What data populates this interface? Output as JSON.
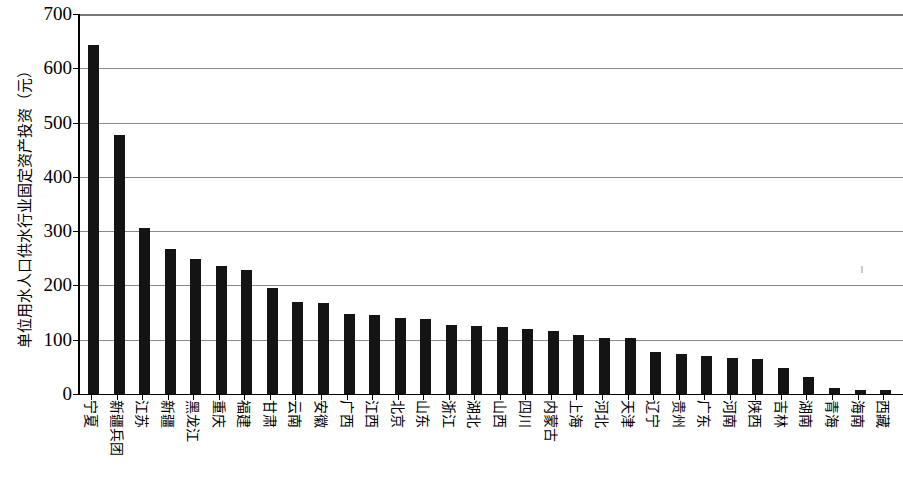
{
  "chart_data": {
    "type": "bar",
    "title": "",
    "subtitle": "",
    "xlabel": "",
    "ylabel": "单位用水人口供水行业固定资产投资（元）",
    "ylim": [
      0,
      700
    ],
    "ytick_labels": [
      "700",
      "600",
      "500",
      "400",
      "300",
      "200",
      "100",
      "0"
    ],
    "ytick_values": [
      700,
      600,
      500,
      400,
      300,
      200,
      100,
      0
    ],
    "grid": true,
    "legend": false,
    "legend_position": "none",
    "bar_color": "#141414",
    "grid_color": "#888888",
    "axis_color": "#000000",
    "categories": [
      "宁夏",
      "新疆兵团",
      "江苏",
      "新疆",
      "黑龙江",
      "重庆",
      "福建",
      "甘肃",
      "云南",
      "安徽",
      "广西",
      "江西",
      "北京",
      "山东",
      "浙江",
      "湖北",
      "山西",
      "四川",
      "内蒙古",
      "上海",
      "河北",
      "天津",
      "辽宁",
      "贵州",
      "广东",
      "河南",
      "陕西",
      "吉林",
      "湖南",
      "青海",
      "海南",
      "西藏"
    ],
    "values": [
      643,
      478,
      306,
      267,
      249,
      236,
      229,
      196,
      170,
      167,
      148,
      145,
      140,
      139,
      128,
      126,
      123,
      120,
      117,
      109,
      104,
      103,
      78,
      73,
      70,
      67,
      65,
      48,
      31,
      12,
      7,
      7
    ]
  }
}
